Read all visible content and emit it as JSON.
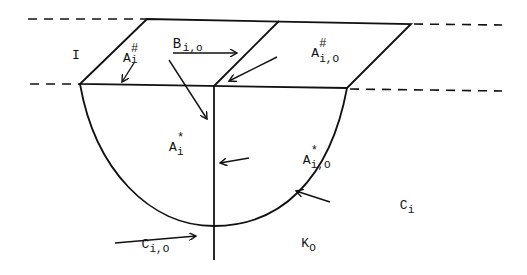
{
  "diagram": {
    "labels": {
      "region_I": "I",
      "A_i_hash": {
        "base": "A",
        "sub": "i",
        "sup": "#"
      },
      "B_i0": {
        "base": "B",
        "sub": "i,o"
      },
      "A_i0_hash": {
        "base": "A",
        "sub": "i,O",
        "sup": "#"
      },
      "A_i_star": {
        "base": "A",
        "sub": "i",
        "sup": "*"
      },
      "A_i0_star": {
        "base": "A",
        "sub": "i,O",
        "sup": "*"
      },
      "C_i": {
        "base": "C",
        "sub": "i"
      },
      "C_i0": {
        "base": "C",
        "sub": "i,O"
      },
      "K_0": {
        "base": "K",
        "sub": "O"
      }
    },
    "stroke_color": "#111111",
    "background": "#ffffff"
  }
}
